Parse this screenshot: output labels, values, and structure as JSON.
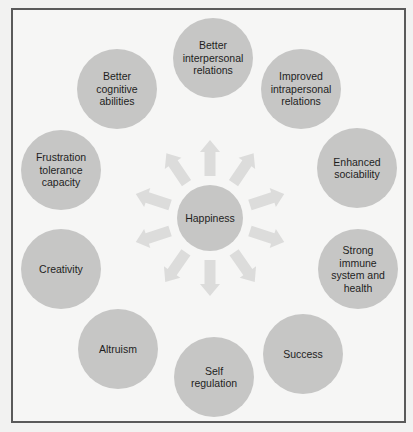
{
  "diagram": {
    "type": "radial-hub",
    "colors": {
      "circle_fill": "#c6c6c5",
      "arrow_fill": "#dcdcdb",
      "frame_border": "#5a5a5a",
      "background": "#f6f6f5",
      "text": "#1e1e1e"
    },
    "center": {
      "label": "Happiness"
    },
    "outcomes": [
      {
        "label": "Better\ninterpersonal\nrelations"
      },
      {
        "label": "Improved\nintrapersonal\nrelations"
      },
      {
        "label": "Enhanced\nsociability"
      },
      {
        "label": "Strong\nimmune\nsystem and\nhealth"
      },
      {
        "label": "Success"
      },
      {
        "label": "Self\nregulation"
      },
      {
        "label": "Altruism"
      },
      {
        "label": "Creativity"
      },
      {
        "label": "Frustration\ntolerance\ncapacity"
      },
      {
        "label": "Better\ncognitive\nabilities"
      }
    ]
  }
}
